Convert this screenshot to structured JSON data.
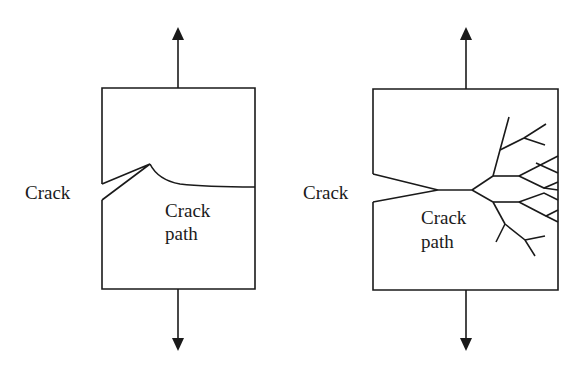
{
  "figure": {
    "panels": [
      {
        "id": "ductile",
        "crack_label": "Crack",
        "crack_path_label": "Crack\npath",
        "crack_path_line1": "Crack",
        "crack_path_line2": "path"
      },
      {
        "id": "brittle-branching",
        "crack_label": "Crack",
        "crack_path_label": "Crack\npath",
        "crack_path_line1": "Crack",
        "crack_path_line2": "path"
      }
    ],
    "colors": {
      "stroke": "#1a1a1a",
      "background": "#ffffff"
    }
  }
}
